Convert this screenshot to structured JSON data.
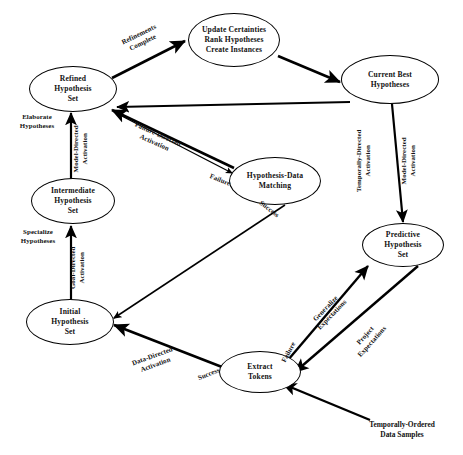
{
  "diagram": {
    "stroke_color": "#000000",
    "background_color": "#ffffff",
    "nodes": [
      {
        "id": "update",
        "label": "Update Certainties\nRank Hypotheses\nCreate Instances"
      },
      {
        "id": "refined",
        "label": "Refined\nHypothesis\nSet"
      },
      {
        "id": "current_best",
        "label": "Current Best\nHypotheses"
      },
      {
        "id": "intermediate",
        "label": "Intermediate\nHypothesis\nSet"
      },
      {
        "id": "hyp_data_match",
        "label": "Hypothesis-Data\nMatching"
      },
      {
        "id": "predictive",
        "label": "Predictive\nHypothesis\nSet"
      },
      {
        "id": "initial",
        "label": "Initial\nHypothesis\nSet"
      },
      {
        "id": "extract",
        "label": "Extract\nTokens"
      }
    ],
    "edge_labels": [
      {
        "id": "refinements_complete",
        "text": "Refinements\nComplete"
      },
      {
        "id": "elaborate_hypotheses",
        "text": "Elaborate\nHypotheses"
      },
      {
        "id": "model_directed_left",
        "text": "Model-Directed\nActivation"
      },
      {
        "id": "failure_directed",
        "text": "Failure-Directed\nActivation"
      },
      {
        "id": "failure_match",
        "text": "Failure"
      },
      {
        "id": "success_match",
        "text": "Success"
      },
      {
        "id": "specialize_hypotheses",
        "text": "Specialize\nHypotheses"
      },
      {
        "id": "goal_directed",
        "text": "Goal-Directed\nActivation"
      },
      {
        "id": "temporally_directed",
        "text": "Temporally-Directed\nActivation"
      },
      {
        "id": "model_directed_right",
        "text": "Model-Directed\nActivation"
      },
      {
        "id": "data_directed",
        "text": "Data-Directed\nActivation"
      },
      {
        "id": "success_extract",
        "text": "Success"
      },
      {
        "id": "failure_extract",
        "text": "Failure"
      },
      {
        "id": "generalize_expectations",
        "text": "Generalize\nExpectations"
      },
      {
        "id": "project_expectations",
        "text": "Project\nExpectations"
      }
    ],
    "captions": [
      {
        "id": "input_source",
        "text": "Temporally-Ordered\nData Samples"
      }
    ]
  }
}
